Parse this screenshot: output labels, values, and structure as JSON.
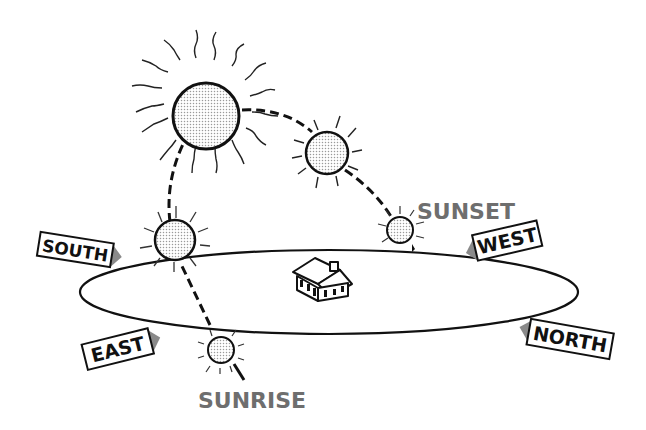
{
  "diagram": {
    "colors": {
      "ink": "#111111",
      "label_gray": "#6e6e6e",
      "sign_shadow": "#8a8a8a",
      "sun_fill": "#e2e2e2",
      "background": "#ffffff"
    },
    "labels": {
      "sunset": "SUNSET",
      "sunrise": "SUNRISE"
    },
    "compass_signs": {
      "south": "SOUTH",
      "west": "WEST",
      "east": "EAST",
      "north": "NORTH"
    },
    "elements": {
      "ground_plane": "horizon-ellipse",
      "house": "house-icon",
      "suns": [
        "sunrise-sun",
        "morning-sun",
        "noon-sun",
        "afternoon-sun",
        "sunset-sun"
      ],
      "path": "dashed-sun-path"
    }
  }
}
